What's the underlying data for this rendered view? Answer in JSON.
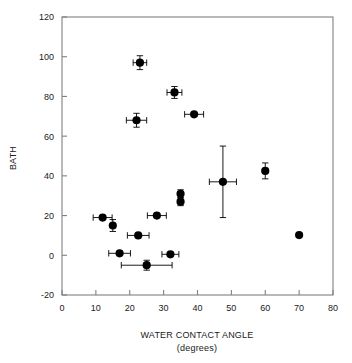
{
  "chart_data": {
    "type": "scatter",
    "title": "",
    "xlabel": "WATER CONTACT ANGLE",
    "xlabel_sub": "(degrees)",
    "ylabel": "BATH",
    "xlim": [
      0,
      80
    ],
    "ylim": [
      -20,
      120
    ],
    "xticks": [
      0,
      10,
      20,
      30,
      40,
      50,
      60,
      70,
      80
    ],
    "yticks": [
      -20,
      0,
      20,
      40,
      60,
      80,
      100,
      120
    ],
    "xtick_labels": [
      "0",
      "10",
      "20",
      "30",
      "40",
      "50",
      "60",
      "70",
      "80"
    ],
    "ytick_labels": [
      "-20",
      "0",
      "20",
      "40",
      "60",
      "80",
      "100",
      "120"
    ],
    "grid": false,
    "legend": null,
    "marker_color": "#000000",
    "marker_shape": "circle",
    "axis_color": "#808080",
    "points": [
      {
        "x": 23.0,
        "y": 97.0,
        "xerr": 2.0,
        "yerr": 3.5
      },
      {
        "x": 33.2,
        "y": 82.0,
        "xerr": 2.2,
        "yerr": 3.0
      },
      {
        "x": 22.0,
        "y": 68.0,
        "xerr": 3.0,
        "yerr": 3.5
      },
      {
        "x": 39.0,
        "y": 71.0,
        "xerr": 2.8,
        "yerr": 0
      },
      {
        "x": 60.0,
        "y": 42.5,
        "xerr": 0,
        "yerr": 4.0
      },
      {
        "x": 47.5,
        "y": 37.0,
        "xerr": 4.0,
        "yerr": 18.0
      },
      {
        "x": 35.0,
        "y": 31.0,
        "xerr": 0,
        "yerr": 2.0
      },
      {
        "x": 35.0,
        "y": 27.0,
        "xerr": 0,
        "yerr": 2.0
      },
      {
        "x": 28.0,
        "y": 20.0,
        "xerr": 2.8,
        "yerr": 0
      },
      {
        "x": 12.0,
        "y": 19.0,
        "xerr": 2.8,
        "yerr": 0
      },
      {
        "x": 15.0,
        "y": 15.0,
        "xerr": 0,
        "yerr": 3.0
      },
      {
        "x": 22.5,
        "y": 10.0,
        "xerr": 3.2,
        "yerr": 0
      },
      {
        "x": 70.0,
        "y": 10.2,
        "xerr": 0,
        "yerr": 0
      },
      {
        "x": 17.0,
        "y": 1.0,
        "xerr": 3.2,
        "yerr": 0
      },
      {
        "x": 32.0,
        "y": 0.5,
        "xerr": 2.5,
        "yerr": 0
      },
      {
        "x": 25.0,
        "y": -5.0,
        "xerr": 7.5,
        "yerr": 2.5
      }
    ]
  }
}
